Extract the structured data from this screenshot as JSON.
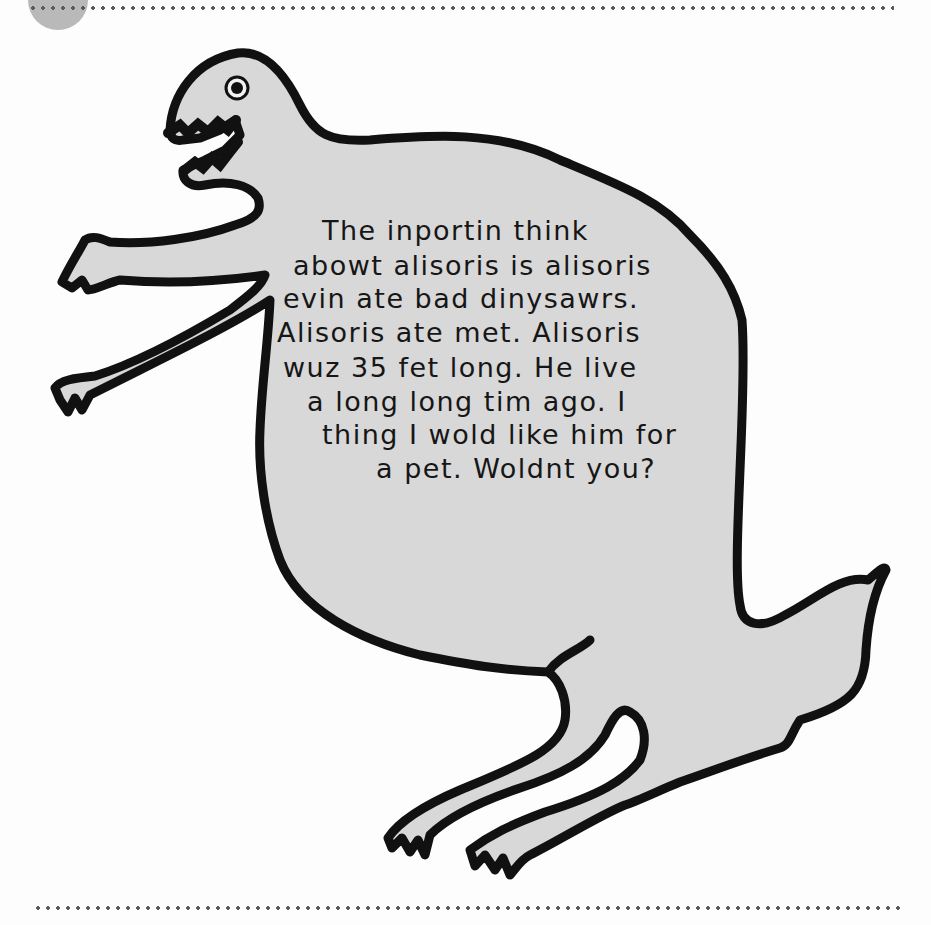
{
  "page": {
    "background": "#fdfdfd",
    "tab_circle_color": "#b9b9b9",
    "rule_color": "#5a5a5a"
  },
  "drawing": {
    "subject": "dinosaur",
    "fill_color": "#d8d8d8",
    "outline_color": "#111111",
    "handwritten_text": {
      "lines": [
        "The inportin think",
        "abowt alisoris is alisoris",
        "evin ate bad dinysawrs.",
        "Alisoris ate met. Alisoris",
        "wuz 35 fet long. He live",
        "a long long tim ago. I",
        "thing I wold like him for",
        "a pet. Woldnt you?"
      ]
    }
  }
}
